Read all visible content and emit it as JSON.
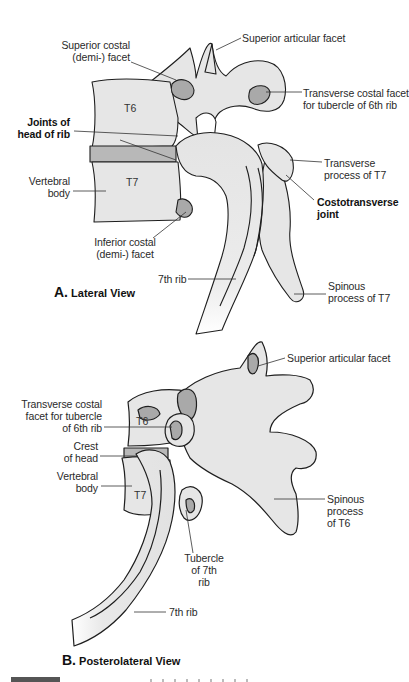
{
  "figure": {
    "colors": {
      "bone_fill": "#e6e6e6",
      "facet_fill": "#a9a9a9",
      "outline": "#1e1e1e",
      "leader": "#333333",
      "background": "#ffffff"
    },
    "panel_a": {
      "caption_letter": "A.",
      "caption_text": "Lateral View",
      "vertebra_tags": [
        "T6",
        "T7"
      ],
      "labels": {
        "superior_costal_facet": [
          "Superior costal",
          "(demi-) facet"
        ],
        "superior_articular_facet": "Superior articular facet",
        "transverse_costal_facet": [
          "Transverse costal facet",
          "for tubercle of 6th rib"
        ],
        "joints_head_of_rib": [
          "Joints of",
          "head of rib"
        ],
        "vertebral_body": [
          "Vertebral",
          "body"
        ],
        "transverse_process_t7": [
          "Transverse",
          "process of T7"
        ],
        "costotransverse_joint": [
          "Costotransverse",
          "joint"
        ],
        "inferior_costal_facet": [
          "Inferior costal",
          "(demi-) facet"
        ],
        "seventh_rib": "7th rib",
        "spinous_process_t7": [
          "Spinous",
          "process of T7"
        ]
      }
    },
    "panel_b": {
      "caption_letter": "B.",
      "caption_text": "Posterolateral View",
      "vertebra_tags": [
        "T6",
        "T7"
      ],
      "labels": {
        "superior_articular_facet": "Superior articular facet",
        "transverse_costal_facet": [
          "Transverse costal",
          "facet for tubercle",
          "of 6th rib"
        ],
        "crest_of_head": [
          "Crest",
          "of head"
        ],
        "vertebral_body": [
          "Vertebral",
          "body"
        ],
        "spinous_process_t6": [
          "Spinous",
          "process",
          "of T6"
        ],
        "tubercle_7th_rib": [
          "Tubercle",
          "of 7th",
          "rib"
        ],
        "seventh_rib": "7th rib"
      }
    }
  }
}
